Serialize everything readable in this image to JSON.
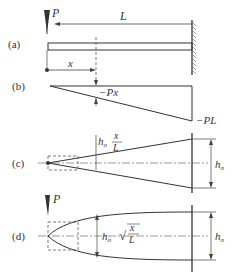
{
  "figure": {
    "panels": [
      {
        "id": "a",
        "label": "(a)",
        "description": "Cantilever beam with tip load P, length L, fixed at right wall"
      },
      {
        "id": "b",
        "label": "(b)",
        "description": "Bending moment diagram, linear from 0 to -PL"
      },
      {
        "id": "c",
        "label": "(c)",
        "description": "Linearly tapered beam depth profile"
      },
      {
        "id": "d",
        "label": "(d)",
        "description": "Parabolic beam depth profile"
      }
    ],
    "labels": {
      "load": "P",
      "length": "L",
      "position": "x",
      "moment_at_x": "−Px",
      "moment_at_wall": "−PL",
      "depth_root": "h",
      "depth_root_sub": "o",
      "depth_linear_num": "x",
      "depth_linear_den": "L",
      "depth_parabolic_num": "x",
      "depth_parabolic_den": "L",
      "sqrt_sign": "√"
    }
  }
}
